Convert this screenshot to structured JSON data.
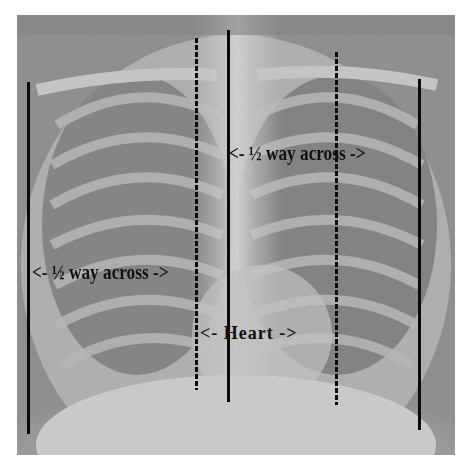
{
  "image": {
    "subject": "chest-xray",
    "background": "#ffffff"
  },
  "annotations": {
    "upper_label": "<- ½ way across ->",
    "left_label": "<- ½ way across ->",
    "heart_label": "<- Heart ->"
  },
  "colors": {
    "lines": "#0a0a0a",
    "text": "#111111"
  }
}
